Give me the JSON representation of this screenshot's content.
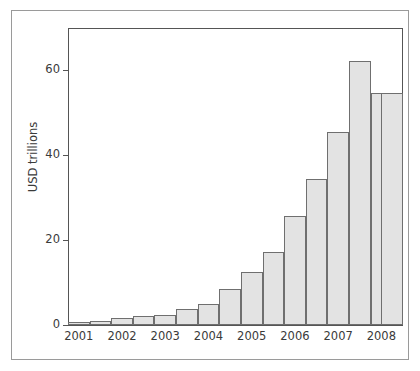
{
  "figure": {
    "background_color": "#ffffff",
    "frame_color": "#9a9a9a",
    "axis_color": "#555555"
  },
  "chart_data": {
    "type": "bar",
    "title": "",
    "subtitle": "",
    "xlabel": "",
    "ylabel": "USD trillions",
    "ylim": [
      0,
      70
    ],
    "xlim": [
      2000.75,
      2008.5
    ],
    "grid": false,
    "legend": null,
    "bar_fill_color": "#e3e3e3",
    "bar_edge_color": "#6f6f6f",
    "y_ticks": [
      0,
      20,
      40,
      60
    ],
    "y_tick_labels": [
      "0",
      "20",
      "40",
      "60"
    ],
    "x_ticks": [
      2001,
      2002,
      2003,
      2004,
      2005,
      2006,
      2007,
      2008
    ],
    "x_tick_labels": [
      "2001",
      "2002",
      "2003",
      "2004",
      "2005",
      "2006",
      "2007",
      "2008"
    ],
    "categories": [
      "2001 H1",
      "2001 H2",
      "2002 H1",
      "2002 H2",
      "2003 H1",
      "2003 H2",
      "2004 H1",
      "2004 H2",
      "2005 H1",
      "2005 H2",
      "2006 H1",
      "2006 H2",
      "2007 H1",
      "2007 H2",
      "2008 H1",
      "2008 H2"
    ],
    "x": [
      2001.0,
      2001.5,
      2002.0,
      2002.5,
      2003.0,
      2003.5,
      2004.0,
      2004.5,
      2005.0,
      2005.5,
      2006.0,
      2006.5,
      2007.0,
      2007.5,
      2008.0,
      2008.25
    ],
    "values": [
      0.6,
      0.9,
      1.6,
      2.1,
      2.4,
      3.8,
      5.0,
      8.4,
      12.4,
      17.1,
      25.6,
      34.4,
      45.5,
      62.2,
      54.6,
      54.6
    ],
    "bar_count": 16
  }
}
